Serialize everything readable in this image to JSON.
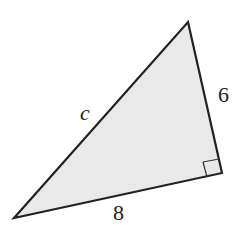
{
  "diagram": {
    "type": "right-triangle",
    "fill_color": "#e9e9e9",
    "stroke_color": "#222222",
    "vertices": {
      "top": [
        188,
        22
      ],
      "right": [
        222,
        173
      ],
      "bottom_left": [
        14,
        218
      ]
    },
    "labels": {
      "hypotenuse": "c",
      "right_leg": "6",
      "bottom_leg": "8"
    },
    "right_angle_marker": "at right vertex"
  }
}
